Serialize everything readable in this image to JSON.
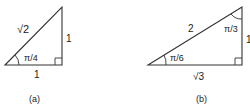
{
  "figure_a": {
    "hypotenuse_label": "√2",
    "vertical_side_label": "1",
    "horizontal_side_label": "1",
    "angle_label": "π/4",
    "caption": "(a)"
  },
  "figure_b": {
    "hypotenuse_label": "2",
    "vertical_side_label": "1",
    "horizontal_side_label": "√3",
    "bottom_angle_label": "π/6",
    "top_angle_label": "π/3",
    "caption": "(b)"
  },
  "colors": {
    "stroke": "#333333",
    "text": "#222222",
    "background": "#ffffff"
  }
}
